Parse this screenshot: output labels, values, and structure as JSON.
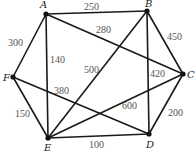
{
  "nodes": {
    "A": {
      "label": "A",
      "x": 46,
      "y": 14,
      "lx": 40,
      "ly": 8
    },
    "B": {
      "label": "B",
      "x": 147,
      "y": 11,
      "lx": 145,
      "ly": 7
    },
    "C": {
      "label": "C",
      "x": 183,
      "y": 74,
      "lx": 187,
      "ly": 78
    },
    "D": {
      "label": "D",
      "x": 149,
      "y": 134,
      "lx": 146,
      "ly": 148
    },
    "E": {
      "label": "E",
      "x": 48,
      "y": 138,
      "lx": 44,
      "ly": 151
    },
    "F": {
      "label": "F",
      "x": 13,
      "y": 77,
      "lx": 3,
      "ly": 81
    }
  },
  "edges": [
    {
      "from": "A",
      "to": "B",
      "weight": "250",
      "lx": 84,
      "ly": 10
    },
    {
      "from": "A",
      "to": "C",
      "weight": "280",
      "lx": 96,
      "ly": 33
    },
    {
      "from": "A",
      "to": "F",
      "weight": "300",
      "lx": 8,
      "ly": 46
    },
    {
      "from": "A",
      "to": "E",
      "weight": "140",
      "lx": 50,
      "ly": 63
    },
    {
      "from": "B",
      "to": "E",
      "weight": "500",
      "lx": 84,
      "ly": 73
    },
    {
      "from": "B",
      "to": "C",
      "weight": "450",
      "lx": 167,
      "ly": 40
    },
    {
      "from": "B",
      "to": "D",
      "weight": "420",
      "lx": 150,
      "ly": 77
    },
    {
      "from": "C",
      "to": "E",
      "weight": "600",
      "lx": 122,
      "ly": 109
    },
    {
      "from": "C",
      "to": "D",
      "weight": "200",
      "lx": 168,
      "ly": 116
    },
    {
      "from": "F",
      "to": "D",
      "weight": "380",
      "lx": 54,
      "ly": 94
    },
    {
      "from": "F",
      "to": "E",
      "weight": "150",
      "lx": 15,
      "ly": 117
    },
    {
      "from": "E",
      "to": "D",
      "weight": "100",
      "lx": 89,
      "ly": 148
    }
  ]
}
